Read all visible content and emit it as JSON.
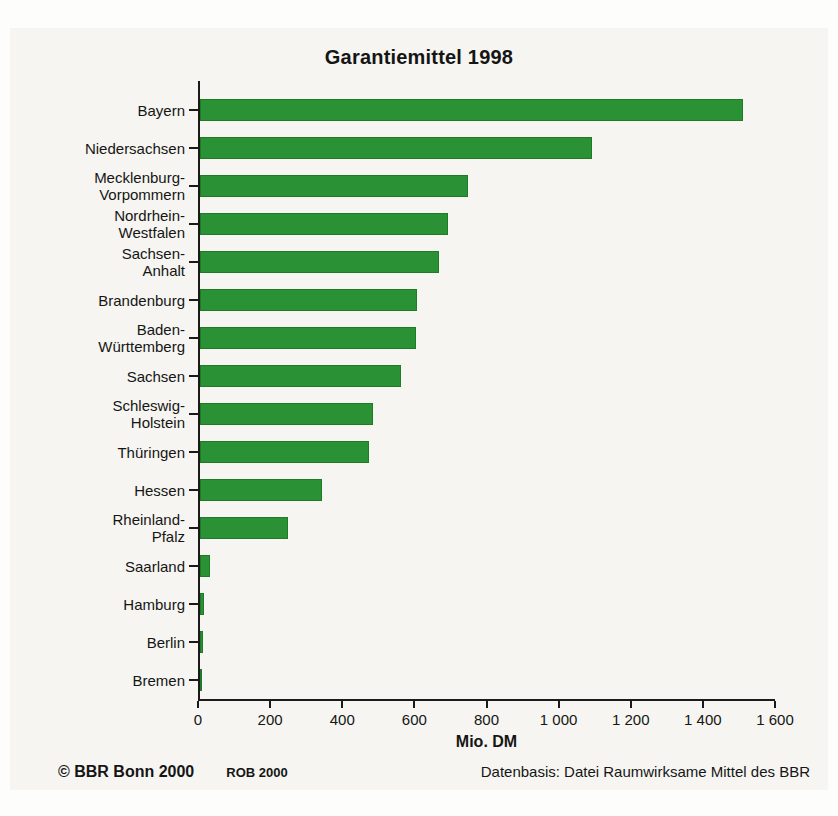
{
  "chart_data": {
    "type": "bar",
    "orientation": "horizontal",
    "title": "Garantiemittel 1998",
    "xlabel": "Mio. DM",
    "xlim": [
      0,
      1600
    ],
    "grid": false,
    "legend": "none",
    "bar_color": "#2a9134",
    "bar_border_color": "#1e7b28",
    "axis_color": "#1a1a1a",
    "categories": [
      "Bayern",
      "Niedersachsen",
      "Mecklenburg-\nVorpommern",
      "Nordrhein-\nWestfalen",
      "Sachsen-\nAnhalt",
      "Brandenburg",
      "Baden-\nWürttemberg",
      "Sachsen",
      "Schleswig-\nHolstein",
      "Thüringen",
      "Hessen",
      "Rheinland-\nPfalz",
      "Saarland",
      "Hamburg",
      "Berlin",
      "Bremen"
    ],
    "values": [
      1510,
      1090,
      745,
      690,
      665,
      605,
      600,
      560,
      480,
      470,
      340,
      245,
      28,
      12,
      8,
      3
    ],
    "xticks": [
      0,
      200,
      400,
      600,
      800,
      1000,
      1200,
      1400,
      1600
    ],
    "xtick_labels": [
      "0",
      "200",
      "400",
      "600",
      "800",
      "1 000",
      "1 200",
      "1 400",
      "1 600"
    ]
  },
  "footer": {
    "copyright": "© BBR Bonn 2000",
    "rob": "ROB 2000",
    "datenbasis": "Datenbasis: Datei Raumwirksame Mittel des BBR"
  }
}
